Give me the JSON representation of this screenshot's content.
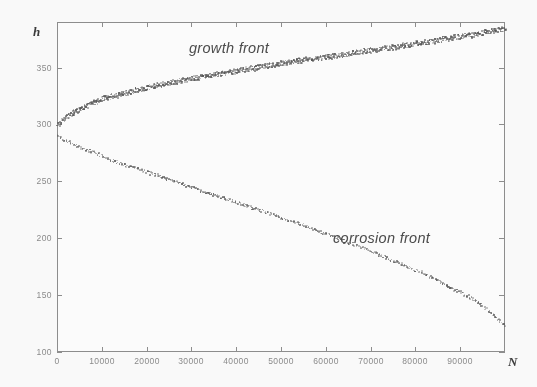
{
  "figure": {
    "background": "#fdfdfd",
    "frame_color": "#8d8d8d"
  },
  "axes": {
    "y_axis_name": "h",
    "x_axis_name": "N",
    "y_ticks": [
      100,
      150,
      200,
      250,
      300,
      350
    ],
    "y_tick_labels": [
      "100",
      "150",
      "200",
      "250",
      "300",
      "350"
    ],
    "x_ticks": [
      0,
      10000,
      20000,
      30000,
      40000,
      50000,
      60000,
      70000,
      80000,
      90000
    ],
    "x_tick_labels": [
      "0",
      "10000",
      "20000",
      "30000",
      "40000",
      "50000",
      "60000",
      "70000",
      "80000",
      "90000"
    ]
  },
  "annotations": {
    "growth_label": "growth front",
    "corrosion_label": "corrosion front"
  },
  "chart_data": {
    "type": "scatter",
    "title": "",
    "xlabel": "N",
    "ylabel": "h",
    "xlim": [
      0,
      100000
    ],
    "ylim": [
      100,
      390
    ],
    "grid": false,
    "legend_position": "inline-annotation",
    "marker_color": "#555555",
    "series": [
      {
        "name": "growth front",
        "marker": "dot",
        "x": [
          0,
          1000,
          2000,
          3000,
          4000,
          5000,
          6000,
          7000,
          8000,
          9000,
          10000,
          12000,
          14000,
          16000,
          18000,
          20000,
          22000,
          24000,
          26000,
          28000,
          30000,
          33000,
          36000,
          39000,
          42000,
          45000,
          48000,
          51000,
          54000,
          57000,
          60000,
          64000,
          68000,
          72000,
          76000,
          80000,
          84000,
          88000,
          92000,
          96000,
          100000
        ],
        "y": [
          300,
          304,
          307,
          310,
          312,
          314,
          316,
          318,
          320,
          321,
          323,
          325,
          327,
          329,
          331,
          333,
          335,
          336,
          338,
          339,
          341,
          343,
          345,
          347,
          349,
          351,
          353,
          355,
          357,
          358,
          360,
          362,
          365,
          367,
          369,
          372,
          374,
          377,
          379,
          382,
          385
        ]
      },
      {
        "name": "corrosion front",
        "marker": "dot",
        "x": [
          0,
          2000,
          4000,
          6000,
          8000,
          10000,
          13000,
          16000,
          19000,
          22000,
          25000,
          28000,
          31000,
          34000,
          37000,
          40000,
          43000,
          46000,
          49000,
          52000,
          55000,
          58000,
          61000,
          64000,
          67000,
          70000,
          73000,
          76000,
          79000,
          82000,
          85000,
          88000,
          91000,
          94000,
          97000,
          100000
        ],
        "y": [
          290,
          286,
          282,
          279,
          276,
          273,
          268,
          264,
          260,
          256,
          252,
          248,
          244,
          240,
          236,
          232,
          228,
          224,
          220,
          216,
          212,
          207,
          203,
          198,
          194,
          189,
          184,
          179,
          174,
          169,
          163,
          157,
          151,
          144,
          134,
          123
        ]
      }
    ]
  }
}
